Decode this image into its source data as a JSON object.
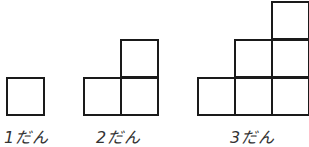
{
  "figures": [
    {
      "label": "1だん",
      "steps": 1
    },
    {
      "label": "2だん",
      "steps": 2
    },
    {
      "label": "3だん",
      "steps": 3
    }
  ],
  "colors": {
    "line": "#1a1a1a",
    "text": "#333333",
    "background": "#ffffff"
  }
}
